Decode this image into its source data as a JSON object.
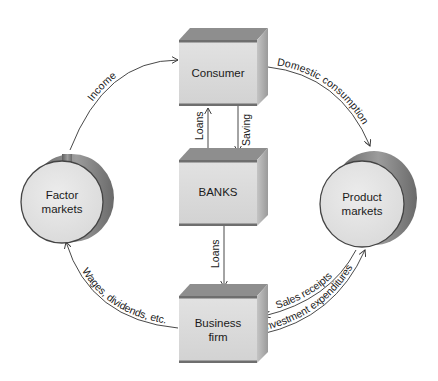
{
  "diagram": {
    "type": "circular-flow",
    "nodes": {
      "consumer": {
        "label": "Consumer",
        "shape": "box"
      },
      "banks": {
        "label": "BANKS",
        "shape": "box"
      },
      "business_firm": {
        "label_line1": "Business",
        "label_line2": "firm",
        "shape": "box"
      },
      "factor_markets": {
        "label_line1": "Factor",
        "label_line2": "markets",
        "shape": "cylinder"
      },
      "product_markets": {
        "label_line1": "Product",
        "label_line2": "markets",
        "shape": "cylinder"
      }
    },
    "flows": {
      "income": {
        "label": "Income",
        "from": "Factor markets",
        "to": "Consumer"
      },
      "domestic_consumption": {
        "label": "Domestic consumption",
        "from": "Consumer",
        "to": "Product markets"
      },
      "loans_to_consumer": {
        "label": "Loans",
        "from": "BANKS",
        "to": "Consumer"
      },
      "saving": {
        "label": "Saving",
        "from": "Consumer",
        "to": "BANKS"
      },
      "loans_to_firm": {
        "label": "Loans",
        "from": "BANKS",
        "to": "Business firm"
      },
      "sales_receipts": {
        "label": "Sales receipts",
        "from": "Product markets",
        "to": "Business firm"
      },
      "investment_expenditures": {
        "label": "Investment expenditures",
        "from": "Business firm",
        "to": "Product markets"
      },
      "wages": {
        "label": "Wages, dividends, etc.",
        "from": "Business firm",
        "to": "Factor markets"
      }
    },
    "colors": {
      "box_front": "#dcdcdc",
      "box_top": "#8c8c8c",
      "box_side": "#b4b4b4",
      "box_edge": "#6e6e6e",
      "circle_face": "#e4e4e4",
      "cylinder_side": "#7a7a7a",
      "line": "#333333"
    }
  }
}
